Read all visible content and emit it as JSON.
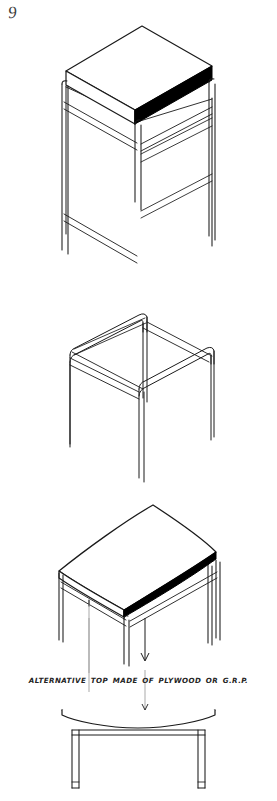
{
  "document": {
    "page_number": "9",
    "caption": "ALTERNATIVE TOP MADE OF PLYWOOD OR G.R.P.",
    "ink_color": "#1a1a1a",
    "fill_color": "#000000",
    "paper_color": "#ffffff"
  },
  "figures": [
    {
      "id": "figure-1",
      "name": "isometric-table-flat-top",
      "description": "Isometric view of tall tubular-frame table with flat rectangular slab top, right-hand edge shaded solid black"
    },
    {
      "id": "figure-2",
      "name": "isometric-frame-only",
      "description": "Isometric view of the bare bent-tube frame without any top"
    },
    {
      "id": "figure-3",
      "name": "isometric-table-curved-top",
      "description": "Isometric view of table with saddle-curved top, front edge shaded solid black"
    },
    {
      "id": "figure-4",
      "name": "front-elevation-curved-top",
      "description": "Front elevation of the table showing the curved top profile and two legs"
    }
  ],
  "annotations": {
    "leader_line": "vertical-leader-from-curved-top-to-elevation",
    "arrow": "down-arrow"
  }
}
